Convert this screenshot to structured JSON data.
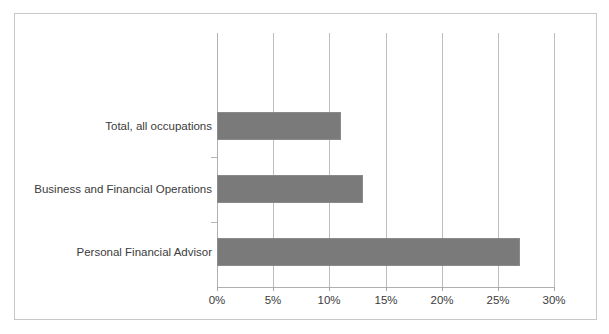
{
  "chart_data": {
    "type": "bar",
    "orientation": "horizontal",
    "title": "",
    "subtitle": "",
    "xlabel": "",
    "ylabel": "",
    "categories": [
      "Total, all occupations",
      "Business and Financial Operations",
      "Personal Financial Advisor"
    ],
    "values": [
      11,
      13,
      27
    ],
    "value_unit": "%",
    "xlim": [
      0,
      30
    ],
    "xticks": [
      0,
      5,
      10,
      15,
      20,
      25,
      30
    ],
    "xtick_labels": [
      "0%",
      "5%",
      "10%",
      "15%",
      "20%",
      "25%",
      "30%"
    ],
    "grid": "vertical",
    "legend": "none",
    "series": [
      {
        "name": "Projected growth",
        "values": [
          11,
          13,
          27
        ],
        "color": "#7a7a7a"
      }
    ],
    "colors": {
      "bar_fill": "#7a7a7a",
      "bar_stroke": "#8a8a8a",
      "gridline": "#bdbdbd",
      "axis_line": "#b0b0b0",
      "frame_border": "#c8c8c8",
      "background": "#ffffff",
      "text": "#3b3b3b"
    },
    "annotations": []
  }
}
